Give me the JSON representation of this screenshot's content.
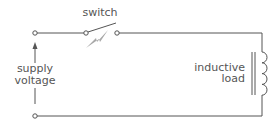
{
  "diagram": {
    "labels": {
      "switch": "switch",
      "supply_line1": "supply",
      "supply_line2": "voltage",
      "load_line1": "inductive",
      "load_line2": "load"
    },
    "colors": {
      "wire": "#555555",
      "spark": "#9a9a9a",
      "text": "#555555"
    }
  }
}
